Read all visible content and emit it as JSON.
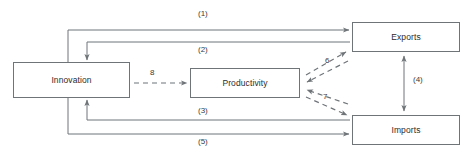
{
  "diagram": {
    "canvas": {
      "width": 473,
      "height": 157,
      "background": "#ffffff"
    },
    "style": {
      "line_color": "#6f7478",
      "box_border_color": "#6f7478",
      "text_color": "#2b2b2b",
      "solid_stroke_width": 1,
      "dashed_stroke_width": 1.2,
      "dash_pattern": "5,4"
    },
    "nodes": [
      {
        "id": "innovation",
        "label": "Innovation",
        "x": 13,
        "y": 62,
        "w": 117,
        "h": 36
      },
      {
        "id": "productivity",
        "label": "Productivity",
        "x": 190,
        "y": 68,
        "w": 110,
        "h": 30
      },
      {
        "id": "exports",
        "label": "Exports",
        "x": 352,
        "y": 22,
        "w": 108,
        "h": 30
      },
      {
        "id": "imports",
        "label": "Imports",
        "x": 352,
        "y": 115,
        "w": 108,
        "h": 30
      }
    ],
    "edges": [
      {
        "id": "e1",
        "label": "(1)",
        "from": "innovation",
        "to": "exports",
        "style": "solid",
        "arrow": "single",
        "route": "orthogonal-top"
      },
      {
        "id": "e2",
        "label": "(2)",
        "from": "exports",
        "to": "innovation",
        "style": "solid",
        "arrow": "single",
        "route": "orthogonal-top"
      },
      {
        "id": "e3",
        "label": "(3)",
        "from": "imports",
        "to": "innovation",
        "style": "solid",
        "arrow": "single",
        "route": "orthogonal-bottom"
      },
      {
        "id": "e5",
        "label": "(5)",
        "from": "innovation",
        "to": "imports",
        "style": "solid",
        "arrow": "single",
        "route": "orthogonal-bottom"
      },
      {
        "id": "e4",
        "label": "(4)",
        "from": "exports",
        "to": "imports",
        "style": "solid",
        "arrow": "double",
        "route": "vertical"
      },
      {
        "id": "e6",
        "label": "6",
        "from": "productivity",
        "to": "exports",
        "style": "dashed",
        "arrow": "bidirectional-pair",
        "route": "diagonal"
      },
      {
        "id": "e7",
        "label": "7",
        "from": "productivity",
        "to": "imports",
        "style": "dashed",
        "arrow": "bidirectional-pair",
        "route": "diagonal"
      },
      {
        "id": "e8",
        "label": "8",
        "from": "innovation",
        "to": "productivity",
        "style": "dashed",
        "arrow": "single",
        "route": "horizontal"
      }
    ],
    "labels": {
      "l1": "(1)",
      "l2": "(2)",
      "l3": "(3)",
      "l4": "(4)",
      "l5": "(5)",
      "l6": "6",
      "l7": "7",
      "l8": "8"
    }
  }
}
